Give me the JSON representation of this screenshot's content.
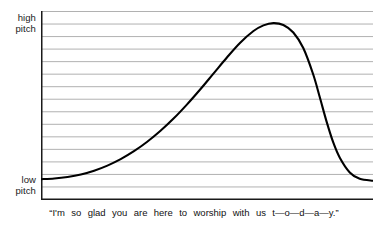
{
  "axis": {
    "y_high_label_line1": "high",
    "y_high_label_line2": "pitch",
    "y_low_label_line1": "low",
    "y_low_label_line2": "pitch"
  },
  "caption": {
    "full_text": "“I’m so glad you are here to worship with us t—o—d—a—y.”",
    "words": [
      "“I'm",
      "so",
      "glad",
      "you",
      "are",
      "here",
      "to",
      "worship",
      "with",
      "us",
      "t—o—d—a—y.”"
    ]
  },
  "colors": {
    "curve": "#000000",
    "gridline": "#a8a8a8",
    "axis": "#1a1a1a",
    "background": "#ffffff",
    "text": "#111111"
  },
  "chart_data": {
    "type": "line",
    "title": "",
    "xlabel": "“I’m so glad you are here to worship with us t—o—d—a—y.”",
    "ylabel": "pitch",
    "ylim": [
      0,
      100
    ],
    "xlim": [
      0,
      100
    ],
    "grid": true,
    "gridline_count": 15,
    "y_tick_labels": [
      "low pitch",
      "high pitch"
    ],
    "legend": null,
    "series": [
      {
        "name": "pitch contour",
        "x": [
          0,
          4,
          8,
          12,
          16,
          20,
          24,
          28,
          32,
          36,
          40,
          44,
          48,
          52,
          56,
          60,
          64,
          67,
          70,
          73,
          76,
          79,
          82,
          84,
          86,
          88,
          90,
          93,
          96,
          100
        ],
        "y": [
          11,
          11.4,
          12.2,
          13.5,
          15.5,
          18.2,
          21.6,
          25.8,
          30.8,
          36.6,
          43.2,
          50.6,
          58.6,
          67,
          75.4,
          83.2,
          89.4,
          92.4,
          93.6,
          92.6,
          88.6,
          80.4,
          66.4,
          54.2,
          41.6,
          30.6,
          22.4,
          14.6,
          11.2,
          10.2
        ]
      }
    ],
    "annotations": [
      {
        "label": "peak",
        "x": 70,
        "y": 93.6
      },
      {
        "label": "onset-low",
        "x": 0,
        "y": 11
      },
      {
        "label": "tail-low",
        "x": 100,
        "y": 10.2
      }
    ]
  }
}
